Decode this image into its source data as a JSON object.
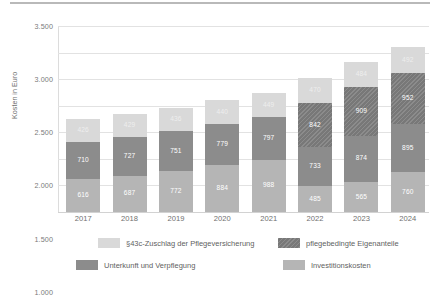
{
  "chart_data": {
    "type": "bar",
    "subtype": "stacked-bar",
    "title": "",
    "xlabel": "",
    "ylabel": "Kosten in Euro",
    "ylim": [
      0,
      3500
    ],
    "ytick_step": 500,
    "ytick_labels": [
      "3.500",
      "3.000",
      "2.500",
      "2.000",
      "1.500",
      "1.000",
      "500",
      "0"
    ],
    "ytick_values": [
      3500,
      3000,
      2500,
      2000,
      1500,
      1000,
      500,
      0
    ],
    "grid": true,
    "grid_axis": "y",
    "legend_position": "bottom",
    "categories": [
      "2017",
      "2018",
      "2019",
      "2020",
      "2021",
      "2022",
      "2023",
      "2024"
    ],
    "stack_order_bottom_to_top": [
      "Investitionskosten",
      "Unterkunft und Verpflegung",
      "pflegebedingte Eigenanteile",
      "§43c-Zuschlag der Pflegeversicherung"
    ],
    "series": [
      {
        "name": "Investitionskosten",
        "color": "#b5b5b5",
        "values": [
          616,
          687,
          772,
          884,
          988,
          485,
          565,
          760
        ],
        "labels": [
          "616",
          "687",
          "772",
          "884",
          "988",
          "485",
          "565",
          "760"
        ]
      },
      {
        "name": "Unterkunft und Verpflegung",
        "color": "#8c8c8c",
        "values": [
          710,
          727,
          751,
          779,
          797,
          733,
          874,
          895
        ],
        "labels": [
          "710",
          "727",
          "751",
          "779",
          "797",
          "733",
          "874",
          "895"
        ]
      },
      {
        "name": "pflegebedingte Eigenanteile",
        "color": "#7f7f7f",
        "values": [
          0,
          0,
          0,
          0,
          0,
          842,
          909,
          952
        ],
        "labels": [
          "",
          "",
          "",
          "",
          "",
          "842",
          "909",
          "952"
        ]
      },
      {
        "name": "§43c-Zuschlag der Pflegeversicherung",
        "color": "#d9d9d9",
        "values": [
          426,
          429,
          436,
          440,
          449,
          470,
          484,
          492
        ],
        "labels": [
          "426",
          "429",
          "436",
          "440",
          "449",
          "470",
          "484",
          "492"
        ]
      }
    ],
    "totals": [
      1752,
      1843,
      1959,
      2103,
      2234,
      2530,
      2832,
      3099
    ],
    "legend": [
      {
        "label": "§43c-Zuschlag der Pflegeversicherung",
        "color": "#d9d9d9"
      },
      {
        "label": "pflegebedingte Eigenanteile",
        "color": "#7f7f7f"
      },
      {
        "label": "Unterkunft und Verpflegung",
        "color": "#8c8c8c"
      },
      {
        "label": "Investitionskosten",
        "color": "#b5b5b5"
      }
    ]
  }
}
